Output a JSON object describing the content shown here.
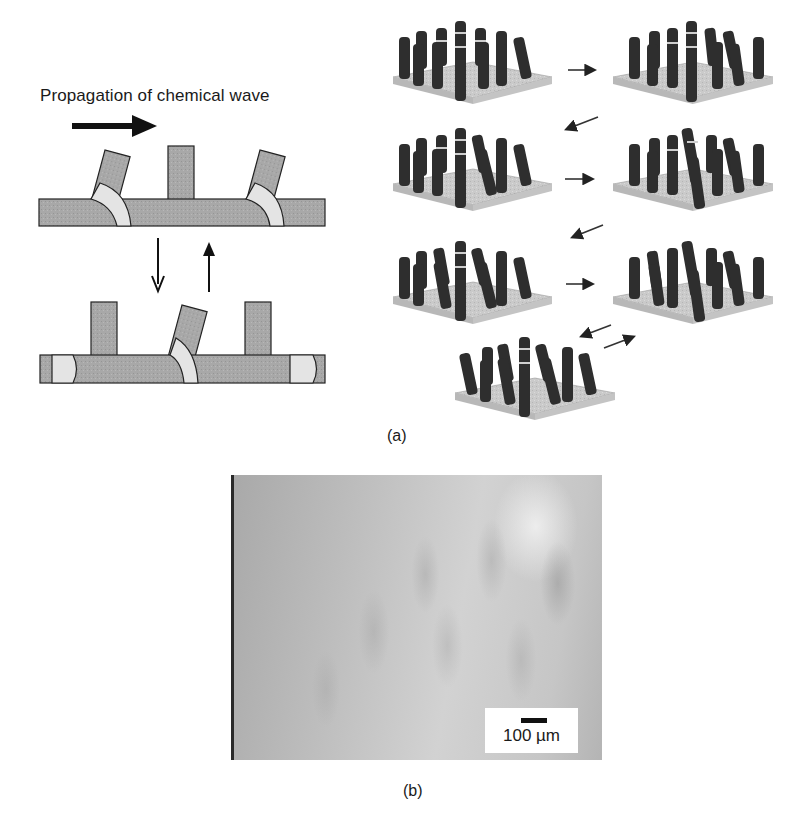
{
  "figure": {
    "panel_a": {
      "label": "(a)",
      "schematic": {
        "title": "Propagation of chemical wave",
        "arrows": {
          "propagation_direction": "right",
          "transition_down": "down",
          "transition_up": "up"
        },
        "top_state": {
          "pillars": [
            "tilted",
            "upright",
            "tilted"
          ]
        },
        "bottom_state": {
          "pillars": [
            "upright",
            "tilted",
            "upright"
          ]
        }
      },
      "pillar_arrays": {
        "count": 7,
        "sequence_arrows": [
          "right",
          "down-left",
          "right",
          "down-left",
          "right",
          "down-left / up-right (reversible)"
        ]
      }
    },
    "panel_b": {
      "label": "(b)",
      "micrograph": {
        "scale_bar_label": "100 µm"
      }
    },
    "colors": {
      "bar_fill": "#a8a8a8",
      "gel_fill": "#e4e4e4",
      "outline": "#222222",
      "pillar_dark": "#2e2e2e",
      "substrate": "#c9c9c9"
    }
  }
}
